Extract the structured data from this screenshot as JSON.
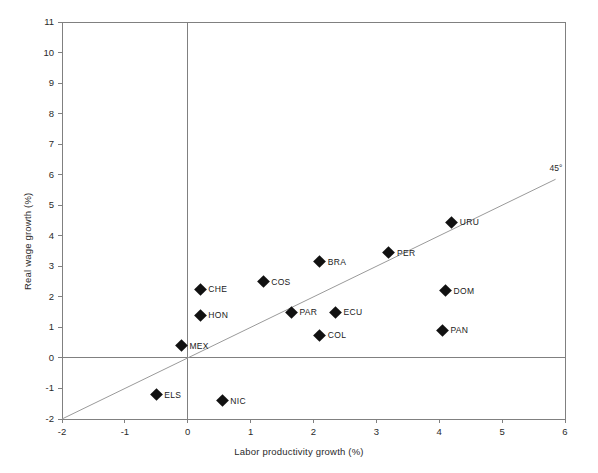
{
  "chart_data": {
    "type": "scatter",
    "title": "",
    "xlabel": "Labor productivity growth (%)",
    "ylabel": "Real wage growth (%)",
    "xlim": [
      -2,
      6
    ],
    "ylim": [
      -2,
      11
    ],
    "xticks": [
      "-2",
      "-1",
      "0",
      "1",
      "2",
      "3",
      "4",
      "5",
      "6"
    ],
    "xtick_values": [
      -2,
      -1,
      0,
      1,
      2,
      3,
      4,
      5,
      6
    ],
    "yticks": [
      "-2",
      "-1",
      "0",
      "1",
      "2",
      "3",
      "4",
      "5",
      "6",
      "7",
      "8",
      "9",
      "10",
      "11"
    ],
    "ytick_values": [
      -2,
      -1,
      0,
      1,
      2,
      3,
      4,
      5,
      6,
      7,
      8,
      9,
      10,
      11
    ],
    "grid": false,
    "legend": "none",
    "marker": "diamond",
    "marker_color": "#111111",
    "axis_color": "#808080",
    "points": [
      {
        "label": "CHE",
        "x": 0.2,
        "y": 2.25,
        "label_side": "right"
      },
      {
        "label": "HON",
        "x": 0.2,
        "y": 1.4,
        "label_side": "right"
      },
      {
        "label": "MEX",
        "x": -0.1,
        "y": 0.4,
        "label_side": "right"
      },
      {
        "label": "ELS",
        "x": -0.5,
        "y": -1.2,
        "label_side": "right"
      },
      {
        "label": "NIC",
        "x": 0.55,
        "y": -1.4,
        "label_side": "right"
      },
      {
        "label": "COS",
        "x": 1.2,
        "y": 2.5,
        "label_side": "right"
      },
      {
        "label": "PAR",
        "x": 1.65,
        "y": 1.5,
        "label_side": "right"
      },
      {
        "label": "BRA",
        "x": 2.1,
        "y": 3.15,
        "label_side": "right"
      },
      {
        "label": "COL",
        "x": 2.1,
        "y": 0.75,
        "label_side": "right"
      },
      {
        "label": "ECU",
        "x": 2.35,
        "y": 1.5,
        "label_side": "right"
      },
      {
        "label": "PER",
        "x": 3.2,
        "y": 3.45,
        "label_side": "right"
      },
      {
        "label": "PAN",
        "x": 4.05,
        "y": 0.9,
        "label_side": "right"
      },
      {
        "label": "DOM",
        "x": 4.1,
        "y": 2.2,
        "label_side": "right"
      },
      {
        "label": "URU",
        "x": 4.2,
        "y": 4.45,
        "label_side": "right"
      }
    ],
    "reference_line": {
      "label": "45°",
      "from": [
        -2,
        -2
      ],
      "to": [
        5.85,
        5.85
      ],
      "slope": 1,
      "intercept": 0
    },
    "zero_lines": {
      "x_zero": 0,
      "y_zero": 0
    }
  }
}
